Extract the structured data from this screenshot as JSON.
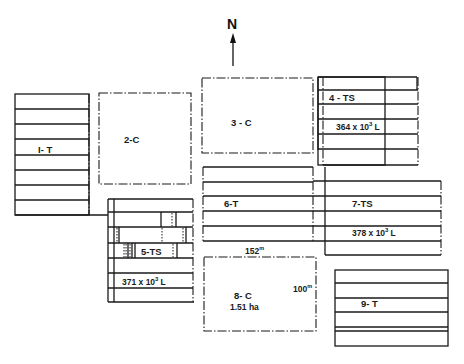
{
  "north": {
    "label": "N"
  },
  "plots": {
    "p1": {
      "label": "I- T"
    },
    "p2": {
      "label": "2-C"
    },
    "p3": {
      "label": "3 - C"
    },
    "p4": {
      "label": "4 - TS",
      "volume": "364 x 10",
      "exp": "3",
      "unit": "L"
    },
    "p5": {
      "label": "5-TS",
      "volume": "371 x 10",
      "exp": "3",
      "unit": "L"
    },
    "p6": {
      "label": "6-T"
    },
    "p7": {
      "label": "7-TS",
      "volume": "378 x 10",
      "exp": "3",
      "unit": "L"
    },
    "p8": {
      "label": "8- C",
      "area": "1.51 ha",
      "width": "152",
      "height": "100",
      "unit_sup": "m"
    },
    "p9": {
      "label": "9- T"
    }
  },
  "colors": {
    "line": "#1a1a1a",
    "background": "#ffffff"
  }
}
